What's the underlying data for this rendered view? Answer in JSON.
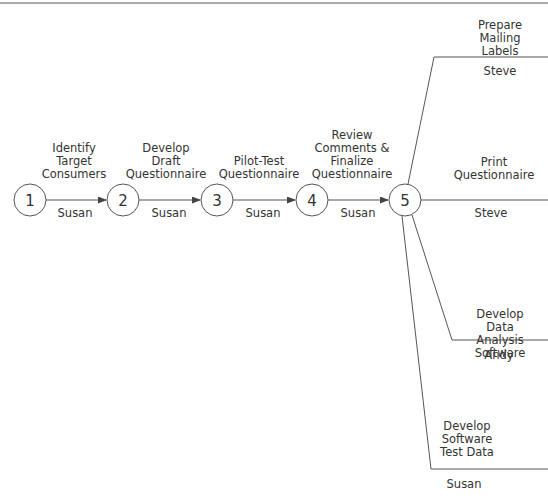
{
  "diagram": {
    "title": "",
    "colors": {
      "line": "#555555",
      "text": "#333333",
      "background": "#ffffff"
    },
    "nodes": [
      {
        "id": "1",
        "label": "1",
        "x": 30,
        "y": 200
      },
      {
        "id": "2",
        "label": "2",
        "x": 123,
        "y": 200
      },
      {
        "id": "3",
        "label": "3",
        "x": 217,
        "y": 200
      },
      {
        "id": "4",
        "label": "4",
        "x": 312,
        "y": 200
      },
      {
        "id": "5",
        "label": "5",
        "x": 405,
        "y": 200
      }
    ],
    "activities": [
      {
        "from": "1",
        "to": "2",
        "name": "Identify\nTarget\nConsumers",
        "owner": "Susan"
      },
      {
        "from": "2",
        "to": "3",
        "name": "Develop\nDraft\nQuestionnaire",
        "owner": "Susan"
      },
      {
        "from": "3",
        "to": "4",
        "name": "Pilot-Test\nQuestionnaire",
        "owner": "Susan"
      },
      {
        "from": "4",
        "to": "5",
        "name": "Review\nComments &\nFinalize\nQuestionnaire",
        "owner": "Susan"
      },
      {
        "from": "5",
        "to": "",
        "name": "Prepare\nMailing Labels",
        "owner": "Steve"
      },
      {
        "from": "5",
        "to": "",
        "name": "Print\nQuestionnaire",
        "owner": "Steve"
      },
      {
        "from": "5",
        "to": "",
        "name": "Develop Data\nAnalysis Software",
        "owner": "Andy"
      },
      {
        "from": "5",
        "to": "",
        "name": "Develop\nSoftware\nTest Data",
        "owner": "Susan"
      }
    ]
  }
}
